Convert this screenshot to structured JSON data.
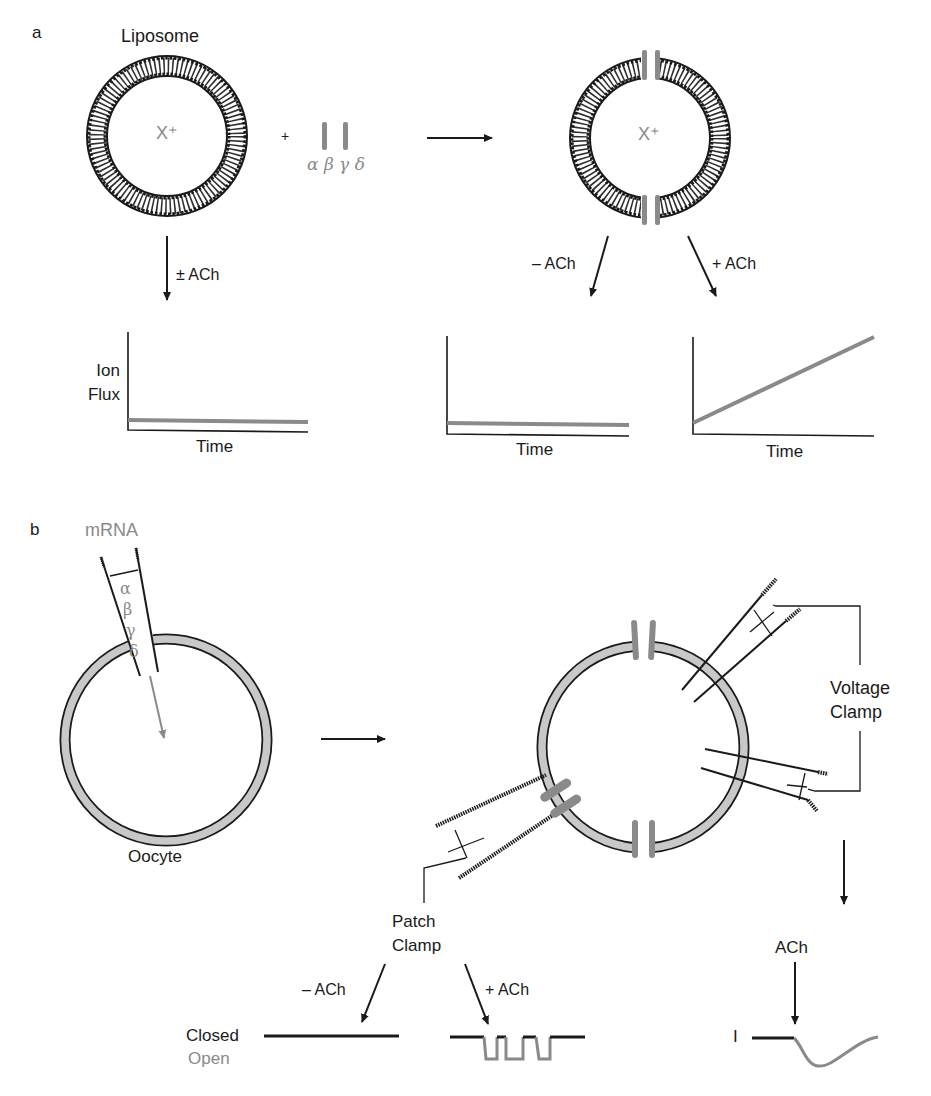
{
  "colors": {
    "ink": "#1a1a1a",
    "protein_gray": "#8a8a8a",
    "membrane_fill": "#c8c8c8"
  },
  "panel_a": {
    "label": "a",
    "liposome_label": "Liposome",
    "ion_label": "X⁺",
    "plus_sign": "+",
    "subunits_label": "α β γ δ",
    "branch_left": "± ACh",
    "branch_minus": "– ACh",
    "branch_plus": "+ ACh",
    "graphs": [
      {
        "ylabel_line1": "Ion",
        "ylabel_line2": "Flux",
        "xlabel": "Time",
        "trend": "flat-low"
      },
      {
        "xlabel": "Time",
        "trend": "flat-low"
      },
      {
        "xlabel": "Time",
        "trend": "linear-increase"
      }
    ]
  },
  "panel_b": {
    "label": "b",
    "mrna_label": "mRNA",
    "subunits": [
      "α",
      "β",
      "γ",
      "δ"
    ],
    "oocyte_label": "Oocyte",
    "voltage_clamp_line1": "Voltage",
    "voltage_clamp_line2": "Clamp",
    "patch_clamp_line1": "Patch",
    "patch_clamp_line2": "Clamp",
    "branch_minus": "– ACh",
    "branch_plus": "+ ACh",
    "ach_label": "ACh",
    "closed_label": "Closed",
    "open_label": "Open",
    "current_label": "I"
  }
}
